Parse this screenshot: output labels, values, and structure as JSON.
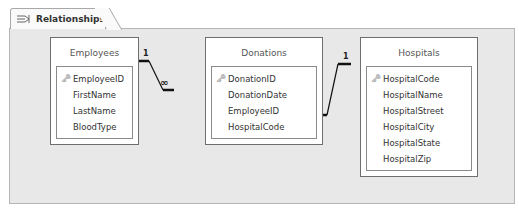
{
  "tab": {
    "label": "Relationships",
    "icon": "relationships-icon"
  },
  "tables": [
    {
      "name": "Employees",
      "primary_key": "EmployeeID",
      "fields": [
        "EmployeeID",
        "FirstName",
        "LastName",
        "BloodType"
      ]
    },
    {
      "name": "Donations",
      "primary_key": "DonationID",
      "fields": [
        "DonationID",
        "DonationDate",
        "EmployeeID",
        "HospitalCode"
      ]
    },
    {
      "name": "Hospitals",
      "primary_key": "HospitalCode",
      "fields": [
        "HospitalCode",
        "HospitalName",
        "HospitalStreet",
        "HospitalCity",
        "HospitalState",
        "HospitalZip"
      ]
    }
  ],
  "relationships": [
    {
      "from": "Employees.EmployeeID",
      "to": "Donations.EmployeeID",
      "one": "1",
      "many": "∞"
    },
    {
      "from": "Hospitals.HospitalCode",
      "to": "Donations.HospitalCode",
      "one": "1",
      "many": "∞"
    }
  ],
  "key_icon": "🗝"
}
